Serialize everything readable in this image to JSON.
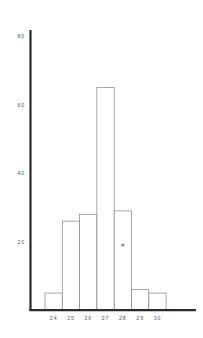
{
  "chart_data": {
    "type": "bar",
    "title": "",
    "subtitle": "",
    "xlabel": "",
    "ylabel": "",
    "categories": [
      "24",
      "25",
      "26",
      "27",
      "28",
      "29",
      "30"
    ],
    "values": [
      5,
      26,
      28,
      65,
      29,
      6,
      5
    ],
    "series": [
      {
        "name": "frequency",
        "values": [
          5,
          26,
          28,
          65,
          29,
          6,
          5
        ]
      }
    ],
    "ylim": [
      0,
      88
    ],
    "xlim": [
      23.5,
      30.5
    ],
    "ytick_labels": [
      "20",
      "40",
      "60",
      "80"
    ],
    "ytick_values": [
      20,
      40,
      60,
      80
    ],
    "xtick_labels": [
      "24",
      "25",
      "26",
      "27",
      "28",
      "29",
      "30"
    ],
    "grid": false,
    "legend": null,
    "legend_position": "none",
    "annotations": [
      {
        "name": "smudge-mark",
        "x_category": "28",
        "y_value": 19,
        "text": ""
      }
    ],
    "bar_fill_color": "#ffffff",
    "bar_edge_color": "#8a8a8a",
    "axis_color": "#2b2b2b",
    "tick_label_color": "#555555",
    "background_color": "#ffffff"
  }
}
